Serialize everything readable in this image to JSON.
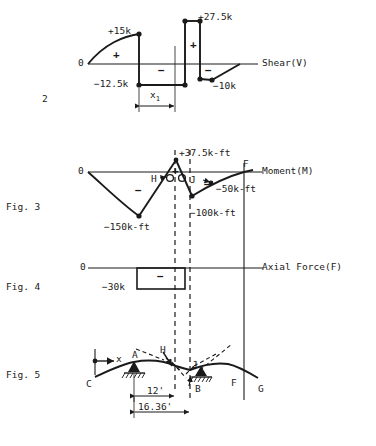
{
  "figure": {
    "page_number": "2"
  },
  "figure_labels": {
    "fig3": "Fig. 3",
    "fig4": "Fig. 4",
    "fig5": "Fig. 5"
  },
  "shear": {
    "name": "Shear (V)",
    "axis_label": "Shear(V)",
    "zero_label": "0",
    "plus_sign_left": "+",
    "plus_sign_right": "+",
    "minus_sign_mid": "−",
    "minus_sign_right": "−",
    "annotations": {
      "peak_left": "+15k",
      "peak_right": "+27.5k",
      "trough_left": "−12.5k",
      "trough_right": "−10k"
    },
    "dimension": {
      "label": "x",
      "subscript": "1"
    }
  },
  "moment": {
    "name": "Moment (M)",
    "axis_label": "Moment(M)",
    "zero_label": "0",
    "plus_sign": "+",
    "minus_sign_left": "−",
    "minus_sign_right": "−",
    "annotations": {
      "peak": "+37.5k-ft",
      "trough_left": "−150k-ft",
      "trough_mid": "−100k-ft",
      "right_value": "−50k-ft"
    },
    "points": {
      "H": "H",
      "J": "J",
      "F": "F"
    }
  },
  "axial": {
    "name": "Axial Force (F)",
    "axis_label": "Axial Force(F)",
    "zero_label": "0",
    "minus_sign": "−",
    "annotations": {
      "value": "−30k"
    }
  },
  "deflected": {
    "name": "Deflected Shape",
    "points": {
      "x_axis": "x",
      "A": "A",
      "B": "B",
      "C": "C",
      "F": "F",
      "G": "G",
      "H": "H",
      "J": "J"
    },
    "dimensions": {
      "span_ab": "12'",
      "span_total": "16.36'"
    }
  },
  "colors": {
    "line": "#1a1a1a",
    "background": "#ffffff"
  }
}
